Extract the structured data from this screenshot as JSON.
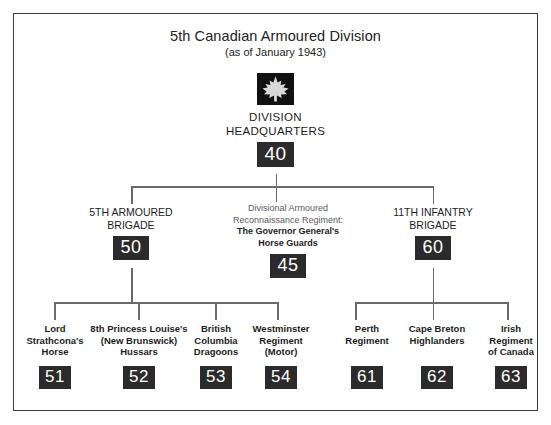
{
  "chart": {
    "type": "org-chart",
    "title": "5th Canadian Armoured Division",
    "subtitle": "(as of January 1943)",
    "insignia": "maple-leaf-insignia",
    "badge_color": "#2b2b2b",
    "badge_text_color": "#ffffff",
    "connector_color": "#6a6a6a",
    "frame_color": "#3a3a3a",
    "root": {
      "label": "DIVISION\nHEADQUARTERS",
      "badge": "40"
    },
    "tier2": [
      {
        "label": "5TH ARMOURED\nBRIGADE",
        "badge": "50"
      },
      {
        "label_regular": "Divisional Armoured\nReconnaissance Regiment:",
        "label_bold": "The Governor General's\nHorse Guards",
        "badge": "45"
      },
      {
        "label": "11TH INFANTRY\nBRIGADE",
        "badge": "60"
      }
    ],
    "tier3_left": [
      {
        "label": "Lord\nStrathcona's\nHorse",
        "badge": "51"
      },
      {
        "label": "8th Princess Louise's\n(New Brunswick)\nHussars",
        "badge": "52"
      },
      {
        "label": "British\nColumbia\nDragoons",
        "badge": "53"
      },
      {
        "label": "Westminster\nRegiment\n(Motor)",
        "badge": "54"
      }
    ],
    "tier3_right": [
      {
        "label": "Perth\nRegiment",
        "badge": "61"
      },
      {
        "label": "Cape Breton\nHighlanders",
        "badge": "62"
      },
      {
        "label": "Irish\nRegiment\nof Canada",
        "badge": "63"
      }
    ]
  }
}
